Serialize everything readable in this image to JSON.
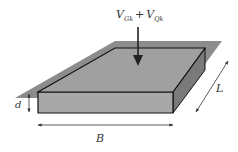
{
  "diagram": {
    "load_label": {
      "main1": "V",
      "sub1": "Gk",
      "op": "+",
      "main2": "V",
      "sub2": "Qk"
    },
    "dimensions": {
      "thickness": "d",
      "width": "B",
      "length": "L"
    },
    "colors": {
      "ground_plane": "#8c8c8c",
      "top_face": "#a0a0a0",
      "front_face": "#a8a8a8",
      "side_face": "#7a7a7a",
      "outline": "#111111",
      "arrow": "#222222",
      "dim_line": "#333333"
    }
  }
}
